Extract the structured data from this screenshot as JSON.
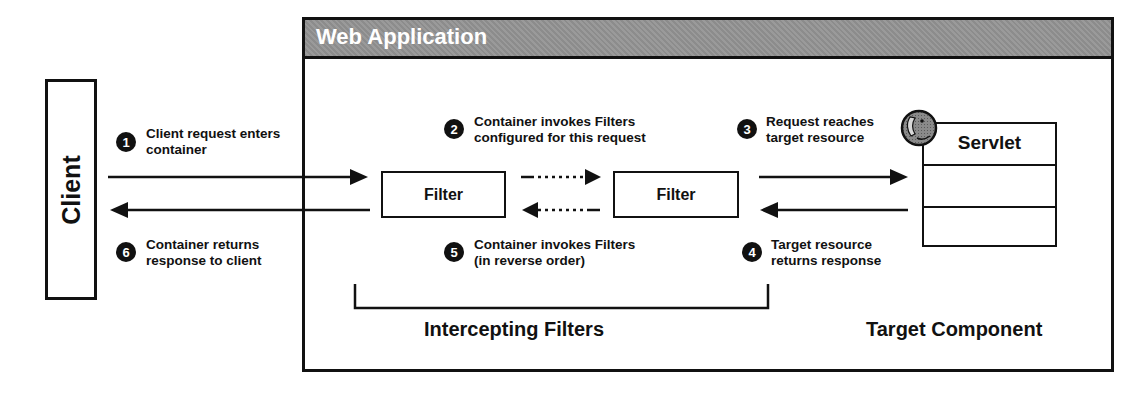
{
  "container": {
    "title": "Web Application"
  },
  "client": {
    "label": "Client"
  },
  "filters": [
    {
      "label": "Filter"
    },
    {
      "label": "Filter"
    }
  ],
  "servlet": {
    "label": "Servlet",
    "icon": "globe-icon"
  },
  "steps": [
    {
      "number": "1",
      "line1": "Client request enters",
      "line2": "container"
    },
    {
      "number": "2",
      "line1": "Container invokes Filters",
      "line2": "configured for this request"
    },
    {
      "number": "3",
      "line1": "Request reaches",
      "line2": "target resource"
    },
    {
      "number": "4",
      "line1": "Target resource",
      "line2": "returns response"
    },
    {
      "number": "5",
      "line1": "Container invokes Filters",
      "line2": "(in reverse order)"
    },
    {
      "number": "6",
      "line1": "Container returns",
      "line2": "response to client"
    }
  ],
  "captions": {
    "intercepting": "Intercepting Filters",
    "target": "Target Component"
  },
  "colors": {
    "header_fill": "#939393",
    "line": "#111111",
    "background": "#ffffff"
  }
}
